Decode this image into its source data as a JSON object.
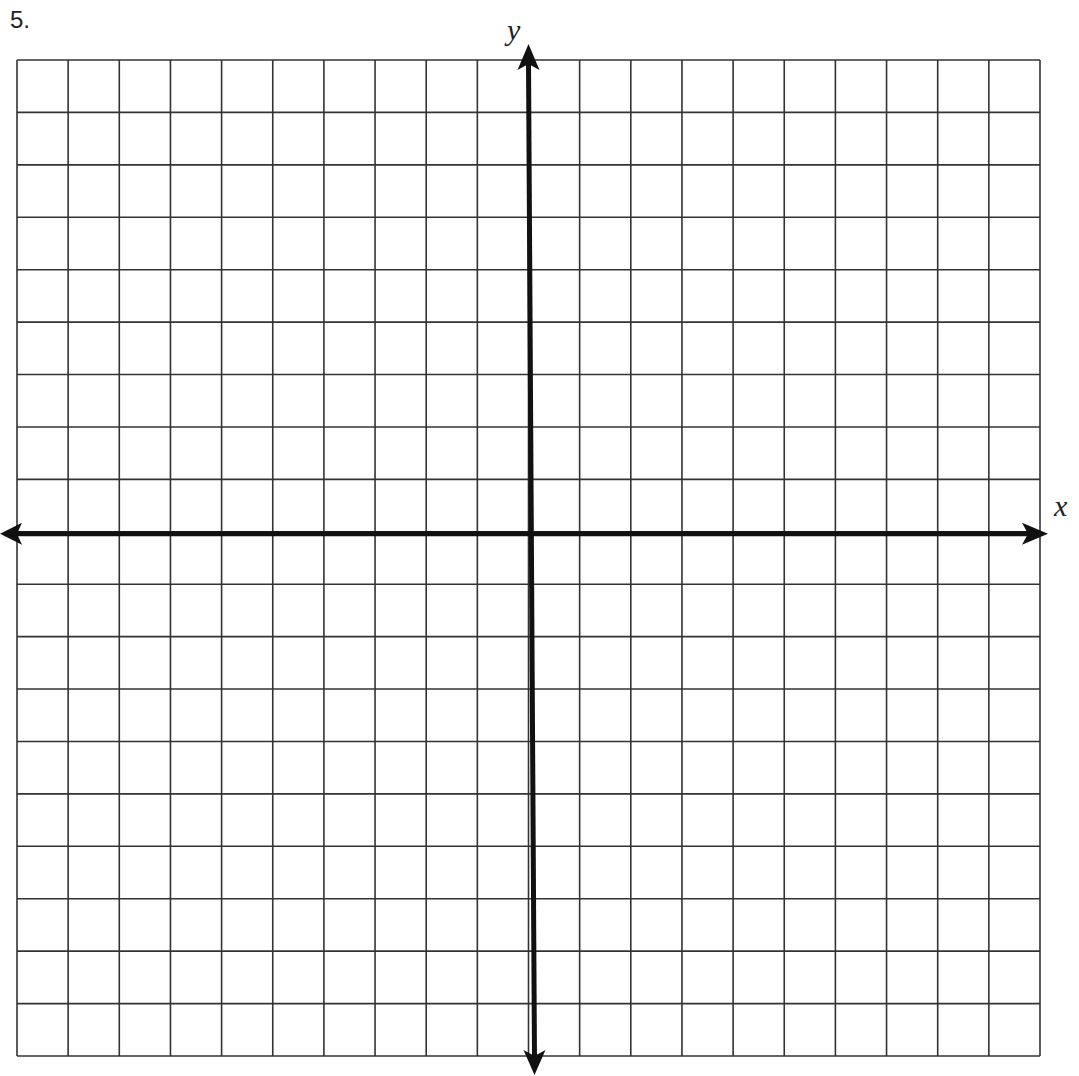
{
  "problem": {
    "number": "5."
  },
  "plane": {
    "columns": 20,
    "rows": 19,
    "y_axis_column": 10,
    "x_axis_row": 9,
    "x_label": "x",
    "y_label": "y",
    "grid_color": "#333333",
    "axis_color": "#111111"
  }
}
